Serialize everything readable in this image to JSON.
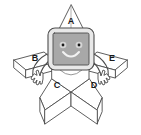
{
  "illustration": {
    "title": "Star character with monitor head",
    "background_color": "#ffffff",
    "outline_color": "#4d4d4d",
    "screen_fill": "#a8a8a8",
    "bezel_fill": "#e8e8e8",
    "body_fill": "#ffffff",
    "label_color": "#1a1a1a",
    "labels": [
      {
        "id": "a",
        "text": "A",
        "part": "top-point",
        "x": 71,
        "y": 22
      },
      {
        "id": "b",
        "text": "B",
        "part": "left-arm",
        "x": 35,
        "y": 59
      },
      {
        "id": "c",
        "text": "C",
        "part": "bottom-left-leg",
        "x": 57,
        "y": 86
      },
      {
        "id": "d",
        "text": "D",
        "part": "bottom-right-leg",
        "x": 94,
        "y": 86
      },
      {
        "id": "e",
        "text": "E",
        "part": "right-arm",
        "x": 112,
        "y": 59
      }
    ],
    "face": {
      "left_eye": "dot",
      "right_eye": "dot",
      "mouth": "smile-curve"
    },
    "parts": {
      "top_point": "A",
      "left_arm": "B",
      "bottom_left_leg": "C",
      "bottom_right_leg": "D",
      "right_arm": "E"
    }
  }
}
